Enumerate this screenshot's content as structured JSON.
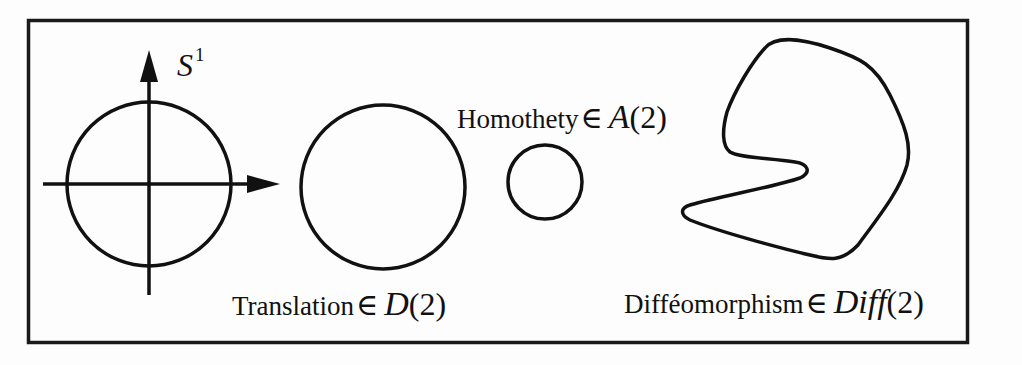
{
  "figure": {
    "frame_color": "#1a1a1a",
    "stroke_color": "#111111",
    "circle_label": {
      "base": "S",
      "superscript": "1"
    },
    "translation": {
      "word": "Translation",
      "symbol": "∈",
      "group": "D",
      "arg": "(2)"
    },
    "homothety": {
      "word": "Homothety",
      "symbol": "∈",
      "group": "A",
      "arg": "(2)"
    },
    "diffeomorphism": {
      "word": "Difféomorphism",
      "symbol": "∈",
      "group": "Diff",
      "arg": "(2)"
    }
  }
}
